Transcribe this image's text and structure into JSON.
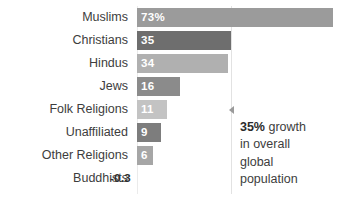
{
  "chart_data": {
    "type": "bar",
    "orientation": "horizontal",
    "title": "",
    "subtitle": "",
    "xlabel": "",
    "ylabel": "",
    "categories": [
      "Muslims",
      "Christians",
      "Hindus",
      "Jews",
      "Folk Religions",
      "Unaffiliated",
      "Other Religions",
      "Buddhists"
    ],
    "values": [
      73,
      35,
      34,
      16,
      11,
      9,
      6,
      -0.3
    ],
    "data_labels": [
      "73%",
      "35",
      "34",
      "16",
      "11",
      "9",
      "6",
      "-0.3"
    ],
    "bar_colors": [
      "#9b9b9b",
      "#6e6e6e",
      "#b0b0b0",
      "#8b8b8b",
      "#c3c3c3",
      "#7d7d7d",
      "#a6a6a6",
      "#9b9b9b"
    ],
    "xlim": [
      0,
      80
    ],
    "grid": false,
    "legend": null,
    "reference_line": {
      "value": 35,
      "color": "#e2e2e2"
    },
    "annotations": [
      {
        "marker": "left-triangle",
        "emphasis": "35%",
        "text": " growth\nin overall\nglobal\npopulation"
      }
    ]
  },
  "colors": {
    "background": "#ffffff",
    "label_text": "#3d3d3d",
    "value_text": "#ffffff",
    "baseline": "#ebebeb",
    "reference_line": "#e2e2e2",
    "marker": "#9a9a9a"
  }
}
